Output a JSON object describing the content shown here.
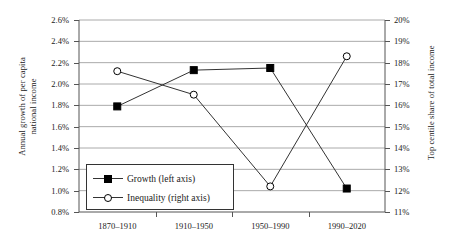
{
  "chart_data": {
    "type": "line",
    "title": "",
    "categories": [
      "1870–1910",
      "1910–1950",
      "1950–1990",
      "1990–2020"
    ],
    "series": [
      {
        "name": "Growth (left axis)",
        "axis": "left",
        "marker": "filled-square",
        "values": [
          1.79,
          2.13,
          2.15,
          1.02
        ]
      },
      {
        "name": "Inequality (right axis)",
        "axis": "right",
        "marker": "open-circle",
        "values": [
          17.6,
          16.5,
          12.2,
          18.3
        ]
      }
    ],
    "xlabel": "",
    "ylabel": "Annual growth of per capita national income",
    "ylabel_right": "Top centile share of total income",
    "ylim": [
      0.8,
      2.6
    ],
    "ylim_right": [
      11,
      20
    ],
    "yticks": [
      "0.8%",
      "1.0%",
      "1.2%",
      "1.4%",
      "1.6%",
      "1.8%",
      "2.0%",
      "2.2%",
      "2.4%",
      "2.6%"
    ],
    "yticks_right": [
      "11%",
      "12%",
      "13%",
      "14%",
      "15%",
      "16%",
      "17%",
      "18%",
      "19%",
      "20%"
    ],
    "grid": true,
    "legend_position": "lower-left-inside",
    "legend": [
      "Growth (left axis)",
      "Inequality (right axis)"
    ],
    "colors": {
      "line": "#333333",
      "grid": "#aaaaaa",
      "axis": "#555555",
      "marker_fill": "#000000"
    }
  },
  "axis_titles": {
    "left_line1": "Annual growth of per capita",
    "left_line2": "national income",
    "right": "Top centile share of total income"
  }
}
